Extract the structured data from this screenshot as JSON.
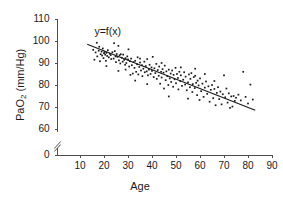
{
  "chart_data": {
    "type": "scatter",
    "title": "",
    "xlabel": "Age",
    "ylabel": "PaO2 (mm/Hg)",
    "ylabel_parts": {
      "base": "PaO",
      "sub": "2",
      "unit": " (mm/Hg)"
    },
    "xlim": [
      0,
      90
    ],
    "ylim": [
      0,
      110
    ],
    "xticks": [
      10,
      20,
      30,
      40,
      50,
      60,
      70,
      80,
      90
    ],
    "yticks": [
      0,
      60,
      70,
      80,
      90,
      100,
      110
    ],
    "y_axis_break": true,
    "y_axis_break_between": [
      0,
      60
    ],
    "grid": false,
    "legend": null,
    "annotations": [
      {
        "text": "y=f(x)",
        "x": 16,
        "y": 104
      }
    ],
    "series": [
      {
        "name": "PaO2 vs Age",
        "type": "scatter",
        "marker": "square",
        "color": "#1a1a1a",
        "points": [
          [
            15.5,
            96.0
          ],
          [
            16.0,
            91.5
          ],
          [
            16.5,
            94.8
          ],
          [
            17.0,
            99.2
          ],
          [
            17.2,
            93.0
          ],
          [
            17.8,
            95.6
          ],
          [
            18.0,
            97.4
          ],
          [
            18.3,
            90.8
          ],
          [
            18.6,
            94.0
          ],
          [
            19.0,
            95.2
          ],
          [
            19.2,
            93.4
          ],
          [
            19.5,
            96.6
          ],
          [
            19.8,
            92.2
          ],
          [
            20.0,
            94.4
          ],
          [
            20.2,
            95.0
          ],
          [
            20.5,
            93.8
          ],
          [
            20.8,
            91.0
          ],
          [
            21.0,
            94.6
          ],
          [
            21.3,
            93.2
          ],
          [
            21.6,
            95.8
          ],
          [
            22.0,
            92.6
          ],
          [
            22.4,
            94.2
          ],
          [
            22.8,
            93.6
          ],
          [
            23.0,
            91.8
          ],
          [
            23.5,
            94.9
          ],
          [
            24.0,
            92.0
          ],
          [
            24.2,
            99.0
          ],
          [
            24.5,
            95.4
          ],
          [
            24.8,
            93.0
          ],
          [
            25.0,
            90.4
          ],
          [
            25.3,
            94.1
          ],
          [
            25.6,
            92.8
          ],
          [
            26.0,
            97.8
          ],
          [
            26.2,
            91.2
          ],
          [
            26.5,
            93.5
          ],
          [
            26.8,
            89.8
          ],
          [
            27.0,
            94.0
          ],
          [
            27.4,
            92.4
          ],
          [
            27.8,
            90.6
          ],
          [
            28.0,
            93.8
          ],
          [
            28.4,
            91.4
          ],
          [
            28.8,
            89.2
          ],
          [
            29.0,
            92.2
          ],
          [
            29.3,
            90.0
          ],
          [
            29.7,
            93.0
          ],
          [
            30.0,
            91.6
          ],
          [
            30.2,
            96.2
          ],
          [
            30.5,
            88.4
          ],
          [
            30.8,
            90.8
          ],
          [
            31.0,
            84.6
          ],
          [
            31.3,
            92.0
          ],
          [
            31.6,
            89.0
          ],
          [
            32.0,
            85.2
          ],
          [
            32.3,
            90.4
          ],
          [
            32.7,
            87.8
          ],
          [
            33.0,
            91.0
          ],
          [
            33.4,
            86.0
          ],
          [
            33.8,
            89.4
          ],
          [
            34.0,
            92.6
          ],
          [
            34.3,
            84.8
          ],
          [
            34.7,
            88.2
          ],
          [
            35.0,
            90.2
          ],
          [
            35.4,
            86.6
          ],
          [
            35.8,
            89.0
          ],
          [
            36.0,
            84.0
          ],
          [
            36.4,
            87.4
          ],
          [
            36.8,
            90.6
          ],
          [
            37.0,
            85.8
          ],
          [
            37.4,
            88.6
          ],
          [
            37.8,
            86.2
          ],
          [
            38.0,
            91.8
          ],
          [
            38.3,
            84.4
          ],
          [
            38.7,
            87.0
          ],
          [
            39.0,
            89.2
          ],
          [
            39.4,
            85.0
          ],
          [
            39.8,
            88.0
          ],
          [
            40.0,
            86.4
          ],
          [
            40.3,
            92.8
          ],
          [
            40.7,
            83.6
          ],
          [
            41.0,
            87.6
          ],
          [
            41.4,
            85.4
          ],
          [
            41.8,
            89.6
          ],
          [
            42.0,
            82.8
          ],
          [
            42.4,
            86.8
          ],
          [
            42.8,
            84.2
          ],
          [
            43.0,
            88.4
          ],
          [
            43.4,
            80.6
          ],
          [
            43.8,
            86.0
          ],
          [
            44.0,
            83.4
          ],
          [
            44.4,
            87.2
          ],
          [
            44.8,
            85.6
          ],
          [
            45.0,
            78.4
          ],
          [
            45.3,
            88.8
          ],
          [
            45.7,
            82.2
          ],
          [
            46.0,
            86.2
          ],
          [
            46.4,
            84.0
          ],
          [
            46.8,
            80.0
          ],
          [
            47.0,
            87.0
          ],
          [
            47.4,
            83.0
          ],
          [
            47.8,
            85.2
          ],
          [
            48.0,
            81.4
          ],
          [
            48.4,
            86.6
          ],
          [
            48.8,
            79.2
          ],
          [
            49.0,
            84.6
          ],
          [
            49.4,
            82.6
          ],
          [
            49.8,
            87.8
          ],
          [
            50.0,
            80.8
          ],
          [
            50.4,
            85.0
          ],
          [
            50.8,
            83.2
          ],
          [
            51.0,
            78.0
          ],
          [
            51.4,
            86.0
          ],
          [
            51.8,
            81.8
          ],
          [
            52.0,
            84.4
          ],
          [
            52.5,
            79.6
          ],
          [
            53.0,
            82.4
          ],
          [
            53.4,
            85.8
          ],
          [
            53.8,
            80.2
          ],
          [
            54.0,
            83.8
          ],
          [
            54.5,
            77.6
          ],
          [
            55.0,
            81.2
          ],
          [
            55.4,
            84.8
          ],
          [
            55.8,
            79.0
          ],
          [
            56.0,
            82.8
          ],
          [
            56.4,
            85.4
          ],
          [
            56.8,
            76.8
          ],
          [
            57.0,
            80.4
          ],
          [
            57.4,
            83.6
          ],
          [
            57.8,
            78.6
          ],
          [
            58.0,
            84.2
          ],
          [
            58.4,
            81.0
          ],
          [
            58.8,
            75.4
          ],
          [
            59.0,
            82.0
          ],
          [
            59.4,
            79.8
          ],
          [
            59.8,
            73.2
          ],
          [
            60.0,
            83.0
          ],
          [
            60.5,
            77.2
          ],
          [
            61.0,
            80.6
          ],
          [
            61.5,
            74.6
          ],
          [
            62.0,
            78.8
          ],
          [
            62.5,
            81.6
          ],
          [
            63.0,
            76.0
          ],
          [
            63.5,
            79.4
          ],
          [
            64.0,
            72.4
          ],
          [
            64.5,
            77.8
          ],
          [
            65.0,
            80.0
          ],
          [
            65.5,
            74.0
          ],
          [
            66.0,
            78.2
          ],
          [
            66.5,
            70.8
          ],
          [
            67.0,
            76.4
          ],
          [
            67.5,
            79.0
          ],
          [
            68.0,
            73.6
          ],
          [
            68.5,
            77.0
          ],
          [
            69.0,
            71.2
          ],
          [
            69.5,
            75.8
          ],
          [
            70.0,
            84.4
          ],
          [
            70.5,
            74.4
          ],
          [
            71.0,
            78.4
          ],
          [
            71.5,
            72.0
          ],
          [
            72.0,
            76.2
          ],
          [
            72.5,
            69.6
          ],
          [
            73.0,
            74.8
          ],
          [
            73.5,
            70.2
          ],
          [
            74.0,
            75.0
          ],
          [
            74.5,
            72.8
          ],
          [
            75.0,
            74.2
          ],
          [
            76.0,
            75.6
          ],
          [
            77.0,
            73.0
          ],
          [
            78.0,
            86.0
          ],
          [
            79.0,
            74.6
          ],
          [
            80.0,
            71.6
          ],
          [
            81.0,
            80.2
          ],
          [
            82.0,
            73.4
          ],
          [
            26.0,
            86.4
          ],
          [
            33.0,
            82.0
          ],
          [
            44.0,
            90.0
          ],
          [
            52.0,
            88.0
          ],
          [
            62.0,
            85.0
          ],
          [
            47.0,
            74.8
          ],
          [
            55.0,
            73.8
          ],
          [
            38.0,
            80.4
          ],
          [
            21.0,
            88.6
          ],
          [
            29.0,
            87.0
          ],
          [
            35.0,
            92.0
          ],
          [
            58.0,
            87.4
          ],
          [
            66.0,
            81.8
          ]
        ]
      },
      {
        "name": "y=f(x)",
        "type": "line",
        "color": "#1a1a1a",
        "endpoints": [
          [
            13.0,
            98.5
          ],
          [
            83.0,
            68.5
          ]
        ]
      }
    ]
  }
}
